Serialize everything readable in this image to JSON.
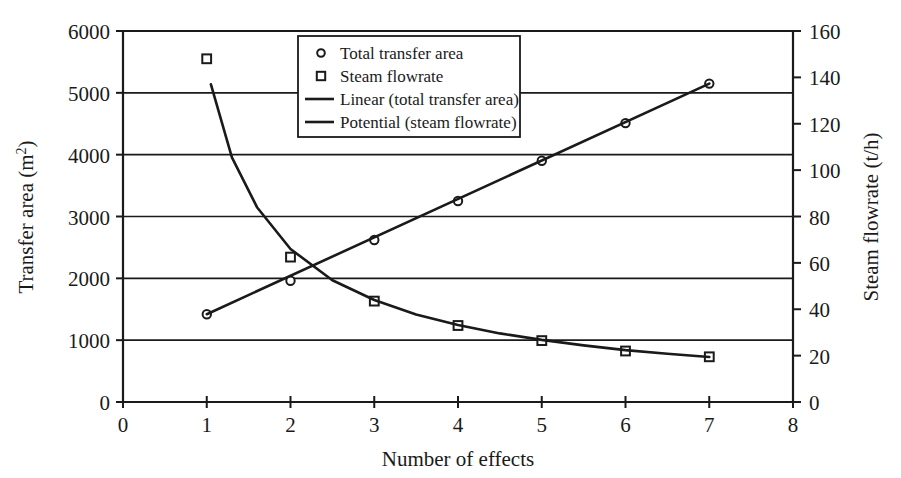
{
  "chart_data": {
    "type": "line",
    "title": "",
    "xlabel": "Number of effects",
    "ylabel": "Transfer area (m2)",
    "ylabel_base": "Transfer area (m",
    "ylabel_sup": "2",
    "ylabel_tail": ")",
    "y2label": "Steam flowrate (t/h)",
    "xlim": [
      0,
      8
    ],
    "ylim": [
      0,
      6000
    ],
    "y2lim": [
      0,
      160
    ],
    "xticks": [
      "0",
      "1",
      "2",
      "3",
      "4",
      "5",
      "6",
      "7",
      "8"
    ],
    "xtick_values": [
      0,
      1,
      2,
      3,
      4,
      5,
      6,
      7,
      8
    ],
    "yticks": [
      "0",
      "1000",
      "2000",
      "3000",
      "4000",
      "5000",
      "6000"
    ],
    "ytick_values": [
      0,
      1000,
      2000,
      3000,
      4000,
      5000,
      6000
    ],
    "y2ticks": [
      "0",
      "20",
      "40",
      "60",
      "80",
      "100",
      "120",
      "140",
      "160"
    ],
    "y2tick_values": [
      0,
      20,
      40,
      60,
      80,
      100,
      120,
      140,
      160
    ],
    "grid": "horizontal",
    "legend_position": "top-center",
    "legend": [
      {
        "label": "Total transfer area",
        "marker": "circle"
      },
      {
        "label": "Steam flowrate",
        "marker": "square"
      },
      {
        "label": "Linear (total transfer area)",
        "marker": "line"
      },
      {
        "label": "Potential (steam flowrate)",
        "marker": "line"
      }
    ],
    "series": [
      {
        "name": "Total transfer area",
        "axis": "left",
        "marker": "circle",
        "x": [
          1,
          2,
          3,
          4,
          5,
          6,
          7
        ],
        "values": [
          1420,
          1960,
          2620,
          3250,
          3900,
          4510,
          5150
        ]
      },
      {
        "name": "Steam flowrate",
        "axis": "right",
        "marker": "square",
        "x": [
          1,
          2,
          3,
          4,
          5,
          6,
          7
        ],
        "values": [
          148,
          62.5,
          43.5,
          33,
          26.5,
          22,
          19.5
        ]
      },
      {
        "name": "Linear (total transfer area)",
        "axis": "left",
        "marker": "line",
        "x": [
          1,
          7
        ],
        "values": [
          1420,
          5150
        ]
      },
      {
        "name": "Potential (steam flowrate)",
        "axis": "right",
        "marker": "line",
        "x": [
          1.05,
          1.3,
          1.6,
          2.0,
          2.5,
          3.0,
          3.5,
          4.0,
          4.5,
          5.0,
          5.5,
          6.0,
          6.5,
          7.0
        ],
        "values": [
          137,
          105.5,
          84,
          66,
          52.5,
          44,
          37.8,
          33.2,
          29.6,
          26.8,
          24.4,
          22.4,
          20.8,
          19.4
        ]
      }
    ]
  }
}
